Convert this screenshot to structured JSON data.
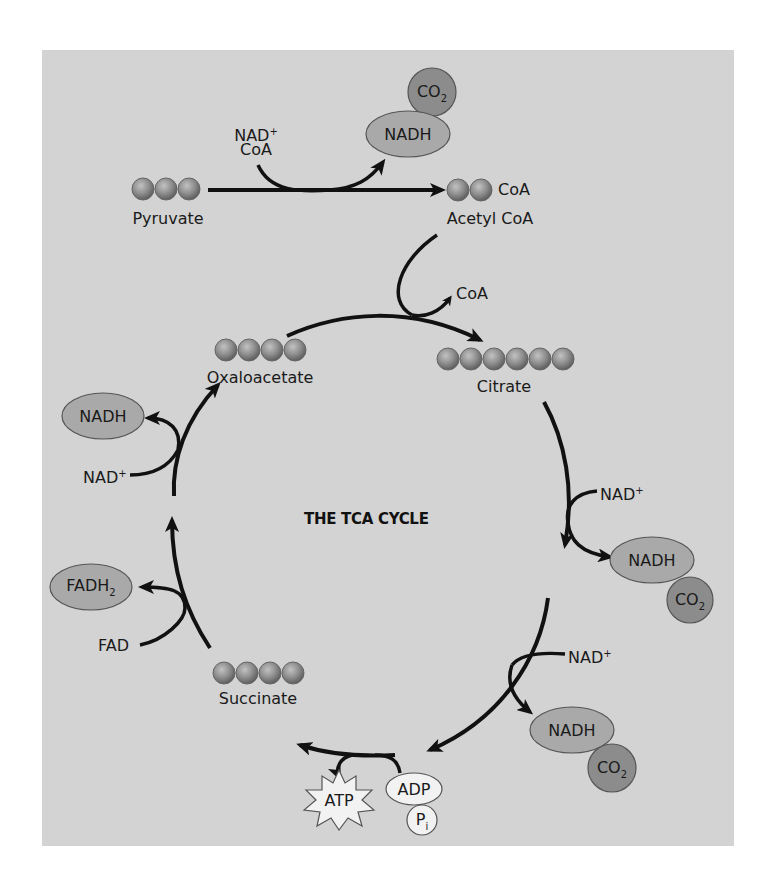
{
  "diagram": {
    "title": "THE TCA CYCLE",
    "colors": {
      "panel_background": "#d3d3d3",
      "sphere_fill": "#8f8f8f",
      "nadh_oval_fill": "#a9a9a9",
      "co2_circle_fill": "#8c8c8c",
      "adp_fill": "#f2f2f2",
      "atp_fill": "#f2f2f2",
      "arrow_color": "#111111"
    },
    "molecules": [
      {
        "id": "pyruvate",
        "label": "Pyruvate",
        "sphere_count": 3
      },
      {
        "id": "acetyl-coa",
        "label": "Acetyl CoA",
        "sphere_count": 2,
        "attached": "CoA"
      },
      {
        "id": "citrate",
        "label": "Citrate",
        "sphere_count": 6
      },
      {
        "id": "succinate",
        "label": "Succinate",
        "sphere_count": 4
      },
      {
        "id": "oxaloacetate",
        "label": "Oxaloacetate",
        "sphere_count": 4
      }
    ],
    "pyruvate_step": {
      "inputs": {
        "nad": "NAD",
        "nad_charge": "+",
        "coa": "CoA"
      },
      "outputs": {
        "nadh": "NADH",
        "co2": "CO",
        "co2_sub": "2"
      }
    },
    "citrate_step": {
      "released": "CoA"
    },
    "right_step_1": {
      "input": "NAD",
      "input_charge": "+",
      "outputs": {
        "nadh": "NADH",
        "co2": "CO",
        "co2_sub": "2"
      }
    },
    "right_step_2": {
      "input": "NAD",
      "input_charge": "+",
      "outputs": {
        "nadh": "NADH",
        "co2": "CO",
        "co2_sub": "2"
      }
    },
    "bottom_step": {
      "inputs": {
        "adp": "ADP",
        "pi": "P",
        "pi_sub": "i"
      },
      "output": "ATP"
    },
    "left_step_fad": {
      "input": "FAD",
      "output": "FADH",
      "output_sub": "2"
    },
    "left_step_nad": {
      "input": "NAD",
      "input_charge": "+",
      "output": "NADH"
    }
  }
}
